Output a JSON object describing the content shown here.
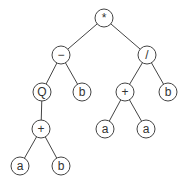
{
  "diagram": {
    "type": "expression-tree",
    "colors": {
      "stroke": "#444444",
      "fill": "#ffffff",
      "text": "#333333"
    },
    "nodes": [
      {
        "id": "n0",
        "label": "*",
        "x": 104,
        "y": 18
      },
      {
        "id": "n1",
        "label": "−",
        "x": 61,
        "y": 55
      },
      {
        "id": "n2",
        "label": "/",
        "x": 147,
        "y": 55
      },
      {
        "id": "n3",
        "label": "Q",
        "x": 42,
        "y": 92
      },
      {
        "id": "n4",
        "label": "b",
        "x": 82,
        "y": 92
      },
      {
        "id": "n5",
        "label": "+",
        "x": 125,
        "y": 92
      },
      {
        "id": "n6",
        "label": "b",
        "x": 168,
        "y": 92
      },
      {
        "id": "n7",
        "label": "+",
        "x": 41,
        "y": 129
      },
      {
        "id": "n8",
        "label": "a",
        "x": 105,
        "y": 129
      },
      {
        "id": "n9",
        "label": "a",
        "x": 146,
        "y": 129
      },
      {
        "id": "n10",
        "label": "a",
        "x": 20,
        "y": 166
      },
      {
        "id": "n11",
        "label": "b",
        "x": 61,
        "y": 166
      }
    ],
    "edges": [
      [
        "n0",
        "n1"
      ],
      [
        "n0",
        "n2"
      ],
      [
        "n1",
        "n3"
      ],
      [
        "n1",
        "n4"
      ],
      [
        "n2",
        "n5"
      ],
      [
        "n2",
        "n6"
      ],
      [
        "n3",
        "n7"
      ],
      [
        "n5",
        "n8"
      ],
      [
        "n5",
        "n9"
      ],
      [
        "n7",
        "n10"
      ],
      [
        "n7",
        "n11"
      ]
    ]
  }
}
